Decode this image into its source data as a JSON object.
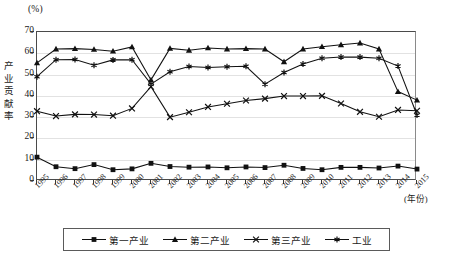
{
  "chart_data": {
    "type": "line",
    "title": "",
    "unit_label": "(%)",
    "ylabel": "产业贡献率",
    "xlabel": "(年份)",
    "ylim": [
      0,
      70
    ],
    "ytick_values": [
      0,
      10,
      20,
      30,
      40,
      50,
      60,
      70
    ],
    "yticks": [
      "0",
      "10",
      "20",
      "30",
      "40",
      "50",
      "60",
      "70"
    ],
    "grid": true,
    "legend_position": "bottom",
    "categories": [
      "1995",
      "1996",
      "1997",
      "1998",
      "1999",
      "2000",
      "2001",
      "2002",
      "2003",
      "2004",
      "2005",
      "2006",
      "2007",
      "2008",
      "2009",
      "2010",
      "2011",
      "2012",
      "2013",
      "2014",
      "2015"
    ],
    "series": [
      {
        "name": "第一产业",
        "marker": "square",
        "values": [
          11.2,
          6.7,
          5.8,
          7.7,
          5.3,
          5.7,
          8.3,
          6.8,
          6.5,
          6.6,
          6.2,
          6.6,
          6.3,
          7.4,
          5.9,
          5.3,
          6.4,
          6.4,
          6.1,
          7.0,
          5.6
        ]
      },
      {
        "name": "第二产业",
        "marker": "triangle",
        "values": [
          55.5,
          62.0,
          62.2,
          61.8,
          61.0,
          63.0,
          47.5,
          62.3,
          61.4,
          62.5,
          62.0,
          62.2,
          62.0,
          56.0,
          62.0,
          63.1,
          64.0,
          64.8,
          62.0,
          42.0,
          38.0
        ]
      },
      {
        "name": "第三产业",
        "marker": "x",
        "values": [
          32.8,
          30.5,
          31.3,
          31.2,
          30.7,
          34.1,
          44.3,
          30.0,
          32.3,
          34.8,
          36.3,
          37.8,
          38.7,
          39.9,
          39.9,
          40.0,
          36.4,
          32.5,
          30.2,
          33.4,
          33.0
        ]
      },
      {
        "name": "工业",
        "marker": "asterisk",
        "values": [
          49.0,
          57.0,
          57.1,
          54.4,
          56.9,
          57.0,
          45.5,
          51.3,
          53.8,
          53.3,
          53.7,
          53.9,
          45.5,
          51.0,
          55.0,
          57.7,
          58.3,
          58.2,
          57.7,
          54.0,
          31.0
        ]
      }
    ]
  },
  "legend": {
    "items": [
      {
        "label": "第一产业",
        "marker": "square"
      },
      {
        "label": "第二产业",
        "marker": "triangle"
      },
      {
        "label": "第三产业",
        "marker": "x"
      },
      {
        "label": "工业",
        "marker": "asterisk"
      }
    ]
  },
  "colors": {
    "line": "#111111",
    "axis": "#4a4a4a",
    "grid": "#e2e2e2",
    "background": "#ffffff"
  }
}
